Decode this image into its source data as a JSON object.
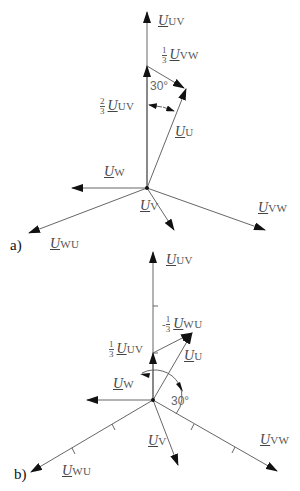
{
  "diagram_a": {
    "tag": "a)",
    "labels": {
      "uv": {
        "sym": "U",
        "sub": "UV"
      },
      "vw_third": {
        "frac_num": "1",
        "frac_den": "3",
        "sym": "U",
        "sub": "VW"
      },
      "uv_two_thirds": {
        "frac_num": "2",
        "frac_den": "3",
        "sym": "U",
        "sub": "UV"
      },
      "u": {
        "sym": "U",
        "sub": "U"
      },
      "w": {
        "sym": "U",
        "sub": "W"
      },
      "v": {
        "sym": "U",
        "sub": "V"
      },
      "vw": {
        "sym": "U",
        "sub": "VW"
      },
      "wu": {
        "sym": "U",
        "sub": "WU"
      }
    },
    "angle": "30°"
  },
  "diagram_b": {
    "tag": "b)",
    "labels": {
      "uv": {
        "sym": "U",
        "sub": "UV"
      },
      "wu_neg_third": {
        "sign": "-",
        "frac_num": "1",
        "frac_den": "3",
        "sym": "U",
        "sub": "WU"
      },
      "uv_third": {
        "frac_num": "1",
        "frac_den": "3",
        "sym": "U",
        "sub": "UV"
      },
      "u": {
        "sym": "U",
        "sub": "U"
      },
      "w": {
        "sym": "U",
        "sub": "W"
      },
      "v": {
        "sym": "U",
        "sub": "V"
      },
      "vw": {
        "sym": "U",
        "sub": "VW"
      },
      "wu": {
        "sym": "U",
        "sub": "WU"
      }
    },
    "angle": "30°"
  }
}
